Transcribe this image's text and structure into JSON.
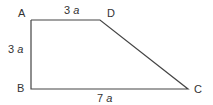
{
  "figure": {
    "type": "trapezoid",
    "stroke_color": "#444444",
    "vertices": [
      {
        "name": "A",
        "label": "A",
        "x": 31,
        "y": 20
      },
      {
        "name": "B",
        "label": "B",
        "x": 31,
        "y": 89
      },
      {
        "name": "C",
        "label": "C",
        "x": 188,
        "y": 89
      },
      {
        "name": "D",
        "label": "D",
        "x": 100,
        "y": 20
      }
    ],
    "sides": {
      "AD": {
        "num": "3",
        "var": "a"
      },
      "AB": {
        "num": "3",
        "var": "a"
      },
      "BC": {
        "num": "7",
        "var": "a"
      }
    }
  }
}
